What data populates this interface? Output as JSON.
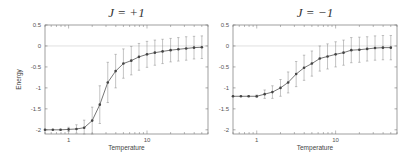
{
  "chart_data": [
    {
      "type": "line",
      "title": "J = +1",
      "xlabel": "Temperature",
      "ylabel": "Energy",
      "xscale": "log",
      "xlim": [
        0.5,
        60
      ],
      "ylim": [
        -2.1,
        0.5
      ],
      "xticks": [
        {
          "v": 1,
          "label": "1"
        },
        {
          "v": 10,
          "label": "10"
        }
      ],
      "yticks": [
        {
          "v": 0.5,
          "label": "0.5"
        },
        {
          "v": 0,
          "label": "0"
        },
        {
          "v": -0.5,
          "label": "-0.5"
        },
        {
          "v": -1,
          "label": "-1"
        },
        {
          "v": -1.5,
          "label": "-1.5"
        },
        {
          "v": -2,
          "label": "-2"
        }
      ],
      "grid": false,
      "reference_line": 0,
      "x": [
        0.5,
        0.63,
        0.79,
        1.0,
        1.26,
        1.58,
        2.0,
        2.5,
        3.16,
        3.98,
        5.0,
        6.3,
        7.9,
        10.0,
        12.6,
        15.8,
        20.0,
        25.1,
        31.6,
        39.8,
        50.1
      ],
      "values": [
        -2.0,
        -2.0,
        -2.0,
        -1.99,
        -1.98,
        -1.95,
        -1.78,
        -1.4,
        -0.87,
        -0.6,
        -0.42,
        -0.35,
        -0.26,
        -0.2,
        -0.16,
        -0.13,
        -0.1,
        -0.08,
        -0.06,
        -0.04,
        -0.03
      ],
      "errors": [
        0.0,
        0.0,
        0.01,
        0.05,
        0.1,
        0.18,
        0.32,
        0.45,
        0.48,
        0.4,
        0.35,
        0.34,
        0.32,
        0.31,
        0.3,
        0.29,
        0.28,
        0.28,
        0.28,
        0.27,
        0.27
      ]
    },
    {
      "type": "line",
      "title": "J = −1",
      "xlabel": "Temperature",
      "ylabel": "",
      "xscale": "log",
      "xlim": [
        0.5,
        60
      ],
      "ylim": [
        -2.1,
        0.5
      ],
      "xticks": [
        {
          "v": 1,
          "label": "1"
        },
        {
          "v": 10,
          "label": "10"
        }
      ],
      "yticks": [
        {
          "v": 0.5,
          "label": "0.5"
        },
        {
          "v": 0,
          "label": "0"
        },
        {
          "v": -0.5,
          "label": "-0.5"
        },
        {
          "v": -1,
          "label": "-1"
        },
        {
          "v": -1.5,
          "label": "-1.5"
        },
        {
          "v": -2,
          "label": "-2"
        }
      ],
      "grid": false,
      "reference_line": 0,
      "x": [
        0.5,
        0.63,
        0.79,
        1.0,
        1.26,
        1.58,
        2.0,
        2.5,
        3.16,
        3.98,
        5.0,
        6.3,
        7.9,
        10.0,
        12.6,
        15.8,
        20.0,
        25.1,
        31.6,
        39.8,
        50.1
      ],
      "values": [
        -1.2,
        -1.2,
        -1.2,
        -1.2,
        -1.15,
        -1.1,
        -1.0,
        -0.87,
        -0.67,
        -0.52,
        -0.42,
        -0.3,
        -0.25,
        -0.2,
        -0.16,
        -0.1,
        -0.09,
        -0.07,
        -0.05,
        -0.04,
        -0.04
      ],
      "errors": [
        0.0,
        0.0,
        0.01,
        0.03,
        0.1,
        0.15,
        0.2,
        0.25,
        0.3,
        0.3,
        0.3,
        0.3,
        0.3,
        0.3,
        0.3,
        0.3,
        0.3,
        0.29,
        0.29,
        0.29,
        0.29
      ]
    }
  ],
  "colors": {
    "line": "#666666",
    "marker": "#444444",
    "frame": "#777777",
    "zero_line": "#cccccc"
  }
}
